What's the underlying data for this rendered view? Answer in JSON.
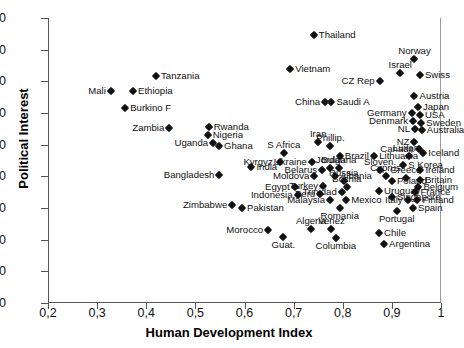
{
  "chart_data": {
    "type": "scatter",
    "title": "",
    "xlabel": "Human Development Index",
    "ylabel": "Political Interest",
    "xlim": [
      0.2,
      1.0
    ],
    "ylim": [
      0,
      90
    ],
    "xticks": [
      "0,2",
      "0,3",
      "0,4",
      "0,5",
      "0,6",
      "0,7",
      "0,8",
      "0,9",
      "1"
    ],
    "xtick_values": [
      0.2,
      0.3,
      0.4,
      0.5,
      0.6,
      0.7,
      0.8,
      0.9,
      1.0
    ],
    "yticks": [
      "0",
      "10",
      "20",
      "30",
      "40",
      "50",
      "60",
      "70",
      "80",
      "90"
    ],
    "ytick_values": [
      0,
      10,
      20,
      30,
      40,
      50,
      60,
      70,
      80,
      90
    ],
    "grid": false,
    "legend": false,
    "marker": "diamond",
    "marker_color": "#111111",
    "points": [
      {
        "label": "Thailand",
        "x": 0.739,
        "y": 84.5,
        "lp": "l"
      },
      {
        "label": "Norway",
        "x": 0.944,
        "y": 77.0,
        "lp": "c_above"
      },
      {
        "label": "Vietnam",
        "x": 0.691,
        "y": 74.0,
        "lp": "l"
      },
      {
        "label": "Tanzania",
        "x": 0.418,
        "y": 71.8,
        "lp": "l"
      },
      {
        "label": "Israel",
        "x": 0.915,
        "y": 72.5,
        "lp": "c_above"
      },
      {
        "label": "Swiss",
        "x": 0.955,
        "y": 72.0,
        "lp": "l"
      },
      {
        "label": "CZ Rep",
        "x": 0.873,
        "y": 70.0,
        "lp": "r"
      },
      {
        "label": "Mali",
        "x": 0.326,
        "y": 67.0,
        "lp": "r"
      },
      {
        "label": "Ethiopia",
        "x": 0.371,
        "y": 67.0,
        "lp": "l"
      },
      {
        "label": "Austria",
        "x": 0.944,
        "y": 65.5,
        "lp": "l"
      },
      {
        "label": "Saudi A",
        "x": 0.775,
        "y": 63.5,
        "lp": "l"
      },
      {
        "label": "China",
        "x": 0.762,
        "y": 63.5,
        "lp": "r"
      },
      {
        "label": "Burkino F",
        "x": 0.355,
        "y": 61.5,
        "lp": "l"
      },
      {
        "label": "Japan",
        "x": 0.951,
        "y": 62.0,
        "lp": "l"
      },
      {
        "label": "Germany",
        "x": 0.938,
        "y": 60.0,
        "lp": "r"
      },
      {
        "label": "USA",
        "x": 0.955,
        "y": 59.5,
        "lp": "l"
      },
      {
        "label": "Denmark",
        "x": 0.941,
        "y": 57.5,
        "lp": "r"
      },
      {
        "label": "Sweden",
        "x": 0.958,
        "y": 57.0,
        "lp": "l"
      },
      {
        "label": "NL",
        "x": 0.945,
        "y": 55.0,
        "lp": "r"
      },
      {
        "label": "Australia",
        "x": 0.959,
        "y": 54.5,
        "lp": "l"
      },
      {
        "label": "Rwanda",
        "x": 0.525,
        "y": 55.5,
        "lp": "l"
      },
      {
        "label": "Zambia",
        "x": 0.445,
        "y": 55.2,
        "lp": "r"
      },
      {
        "label": "Nigeria",
        "x": 0.523,
        "y": 53.0,
        "lp": "l"
      },
      {
        "label": "Uganda",
        "x": 0.534,
        "y": 50.5,
        "lp": "r"
      },
      {
        "label": "Ghana",
        "x": 0.546,
        "y": 49.5,
        "lp": "l"
      },
      {
        "label": "NZ",
        "x": 0.944,
        "y": 51.0,
        "lp": "r"
      },
      {
        "label": "Canada",
        "x": 0.953,
        "y": 48.5,
        "lp": "r"
      },
      {
        "label": "Iceland",
        "x": 0.962,
        "y": 47.5,
        "lp": "l"
      },
      {
        "label": "Iran",
        "x": 0.748,
        "y": 51.0,
        "lp": "c_above"
      },
      {
        "label": "Phillip.",
        "x": 0.773,
        "y": 49.5,
        "lp": "c_above"
      },
      {
        "label": "S Africa",
        "x": 0.678,
        "y": 47.5,
        "lp": "c_above"
      },
      {
        "label": "Brazil",
        "x": 0.792,
        "y": 46.5,
        "lp": "l"
      },
      {
        "label": "Lithuania",
        "x": 0.862,
        "y": 46.5,
        "lp": "l"
      },
      {
        "label": "Luxem.",
        "x": 0.932,
        "y": 46.5,
        "lp": "c_above"
      },
      {
        "label": "Kyrgyz.",
        "x": 0.671,
        "y": 44.5,
        "lp": "r"
      },
      {
        "label": "Ukraine",
        "x": 0.735,
        "y": 44.5,
        "lp": "r"
      },
      {
        "label": "S Korea",
        "x": 0.921,
        "y": 43.5,
        "lp": "l"
      },
      {
        "label": "India",
        "x": 0.612,
        "y": 43.0,
        "lp": "l"
      },
      {
        "label": "Belarus",
        "x": 0.756,
        "y": 42.0,
        "lp": "r"
      },
      {
        "label": "Jordan",
        "x": 0.773,
        "y": 42.5,
        "lp": "c_above"
      },
      {
        "label": "Bulgaria",
        "x": 0.79,
        "y": 42.5,
        "lp": "c_above"
      },
      {
        "label": "Sloven.",
        "x": 0.874,
        "y": 42.0,
        "lp": "c_above"
      },
      {
        "label": "Ireland",
        "x": 0.956,
        "y": 42.0,
        "lp": "l"
      },
      {
        "label": "Bangladesh",
        "x": 0.547,
        "y": 40.5,
        "lp": "r"
      },
      {
        "label": "Moldova",
        "x": 0.74,
        "y": 40.0,
        "lp": "r"
      },
      {
        "label": "Albania",
        "x": 0.782,
        "y": 40.0,
        "lp": "l"
      },
      {
        "label": "Cyprus",
        "x": 0.885,
        "y": 40.0,
        "lp": "c_above"
      },
      {
        "label": "Greece",
        "x": 0.926,
        "y": 39.5,
        "lp": "c_above"
      },
      {
        "label": "Britain",
        "x": 0.955,
        "y": 39.0,
        "lp": "l"
      },
      {
        "label": "Russia",
        "x": 0.8,
        "y": 38.5,
        "lp": "c_above"
      },
      {
        "label": "Poland",
        "x": 0.898,
        "y": 38.5,
        "lp": "l"
      },
      {
        "label": "Egypt",
        "x": 0.7,
        "y": 36.5,
        "lp": "r"
      },
      {
        "label": "Turkey",
        "x": 0.758,
        "y": 37.0,
        "lp": "r"
      },
      {
        "label": "Bosnia",
        "x": 0.806,
        "y": 36.5,
        "lp": "c_above"
      },
      {
        "label": "Belgium",
        "x": 0.952,
        "y": 36.5,
        "lp": "l"
      },
      {
        "label": "Indonesia",
        "x": 0.706,
        "y": 34.0,
        "lp": "r"
      },
      {
        "label": "Peru",
        "x": 0.752,
        "y": 34.5,
        "lp": "r"
      },
      {
        "label": "Trinidad",
        "x": 0.796,
        "y": 35.0,
        "lp": "r"
      },
      {
        "label": "Uruguay",
        "x": 0.872,
        "y": 35.5,
        "lp": "l"
      },
      {
        "label": "France",
        "x": 0.946,
        "y": 35.0,
        "lp": "l"
      },
      {
        "label": "Singapore",
        "x": 0.898,
        "y": 33.5,
        "lp": "l"
      },
      {
        "label": "Malaysia",
        "x": 0.772,
        "y": 32.5,
        "lp": "r"
      },
      {
        "label": "Mexico",
        "x": 0.805,
        "y": 32.5,
        "lp": "l"
      },
      {
        "label": "Italy",
        "x": 0.93,
        "y": 32.5,
        "lp": "r"
      },
      {
        "label": "Finland",
        "x": 0.95,
        "y": 32.5,
        "lp": "l"
      },
      {
        "label": "Zimbabwe",
        "x": 0.573,
        "y": 31.0,
        "lp": "r"
      },
      {
        "label": "Pakistan",
        "x": 0.593,
        "y": 30.0,
        "lp": "l"
      },
      {
        "label": "Romania",
        "x": 0.792,
        "y": 30.0,
        "lp": "c_below"
      },
      {
        "label": "Spain",
        "x": 0.941,
        "y": 30.0,
        "lp": "l"
      },
      {
        "label": "Portugal",
        "x": 0.908,
        "y": 29.0,
        "lp": "c_below"
      },
      {
        "label": "Morocco",
        "x": 0.646,
        "y": 23.0,
        "lp": "r"
      },
      {
        "label": "Algeria",
        "x": 0.733,
        "y": 23.5,
        "lp": "c_above"
      },
      {
        "label": "Venez",
        "x": 0.775,
        "y": 23.5,
        "lp": "c_above"
      },
      {
        "label": "Chile",
        "x": 0.872,
        "y": 22.0,
        "lp": "l"
      },
      {
        "label": "Guat.",
        "x": 0.677,
        "y": 21.0,
        "lp": "c_below"
      },
      {
        "label": "Columbia",
        "x": 0.784,
        "y": 20.5,
        "lp": "c_below"
      },
      {
        "label": "Argentina",
        "x": 0.882,
        "y": 18.5,
        "lp": "l"
      }
    ]
  }
}
